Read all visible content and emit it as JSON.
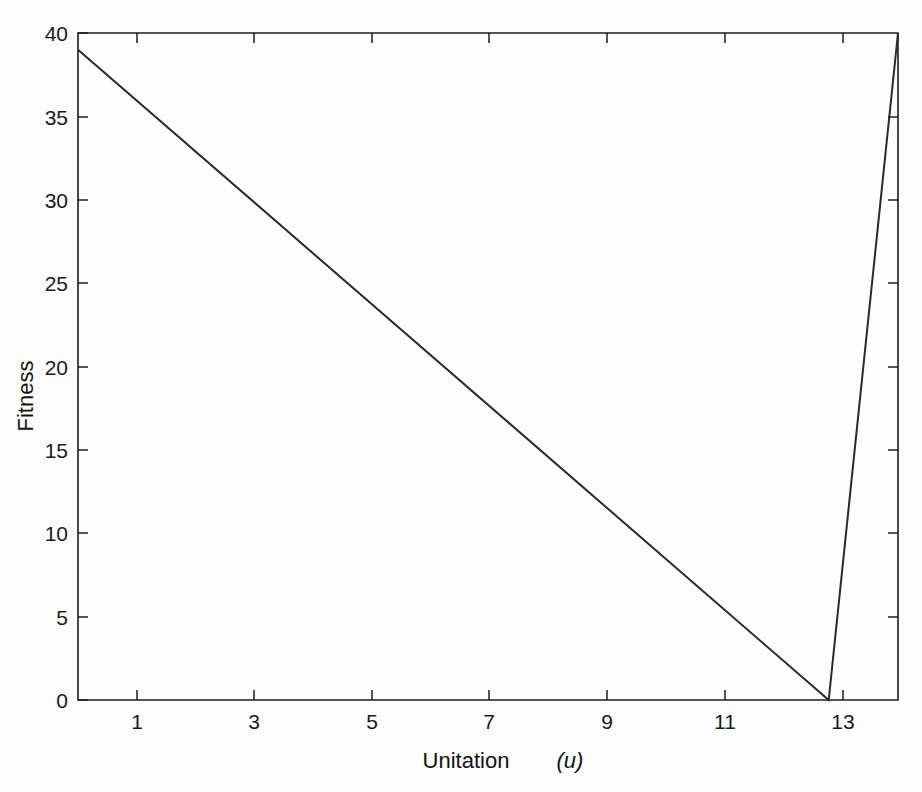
{
  "chart_data": {
    "type": "line",
    "title": "",
    "xlabel": "Unitation",
    "xlabel_variable": "(u)",
    "ylabel": "Fitness",
    "xlim": [
      0,
      14.2
    ],
    "ylim": [
      0,
      40
    ],
    "grid": false,
    "legend": null,
    "x_ticks": [
      1,
      3,
      5,
      7,
      9,
      11,
      13
    ],
    "x_tick_labels": [
      "1",
      "3",
      "5",
      "7",
      "9",
      "11",
      "13"
    ],
    "x_minor_ticks": [
      2,
      4,
      6,
      8,
      10,
      12,
      14
    ],
    "y_ticks": [
      0,
      5,
      10,
      15,
      20,
      25,
      30,
      35,
      40
    ],
    "y_tick_labels": [
      "0",
      "5",
      "10",
      "15",
      "20",
      "25",
      "30",
      "35",
      "40"
    ],
    "series": [
      {
        "name": "fitness",
        "color": "#2a2a2a",
        "x": [
          0,
          13,
          14.2
        ],
        "values": [
          39,
          0,
          40
        ]
      }
    ],
    "points": [
      {
        "x": 0,
        "y": 39
      },
      {
        "x": 1,
        "y": 36
      },
      {
        "x": 2,
        "y": 33
      },
      {
        "x": 3,
        "y": 30
      },
      {
        "x": 4,
        "y": 27
      },
      {
        "x": 5,
        "y": 24
      },
      {
        "x": 6,
        "y": 21
      },
      {
        "x": 7,
        "y": 18
      },
      {
        "x": 8,
        "y": 15
      },
      {
        "x": 9,
        "y": 12
      },
      {
        "x": 10,
        "y": 9
      },
      {
        "x": 11,
        "y": 6
      },
      {
        "x": 12,
        "y": 3
      },
      {
        "x": 13,
        "y": 0
      },
      {
        "x": 14.2,
        "y": 40
      }
    ]
  },
  "figure": {
    "background_color": "#fdfdfd",
    "axis_color": "#1c1c1c",
    "line_color": "#2a2a2a"
  }
}
